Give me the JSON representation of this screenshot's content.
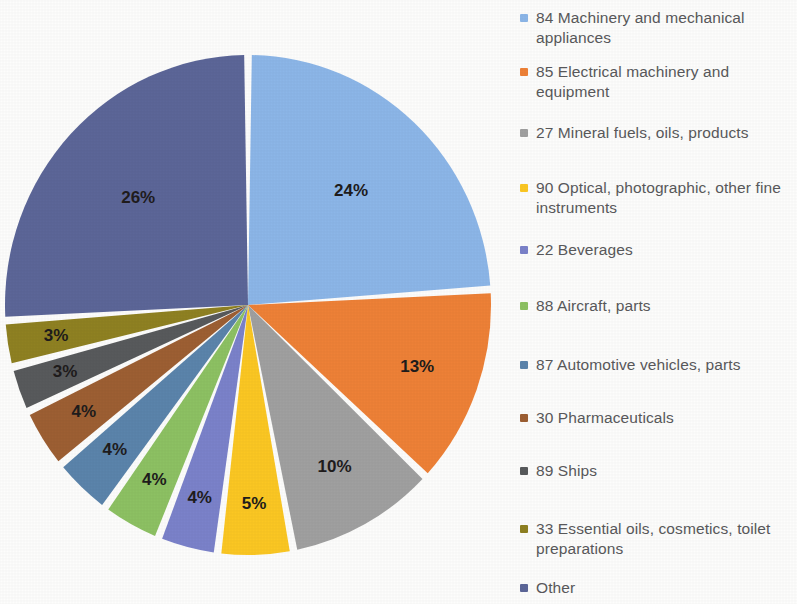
{
  "chart_data": {
    "type": "pie",
    "title": "",
    "subtitle": "",
    "xlabel": "",
    "ylabel": "",
    "legend_position": "right",
    "grid": false,
    "value_suffix": "%",
    "categories": [
      "84 Machinery and mechanical appliances",
      "85 Electrical machinery and equipment",
      "27 Mineral fuels, oils, products",
      "90 Optical, photographic, other fine instruments",
      "22 Beverages",
      "88 Aircraft, parts",
      "87 Automotive vehicles, parts",
      "30 Pharmaceuticals",
      "89 Ships",
      "33 Essential oils, cosmetics, toilet preparations",
      "Other"
    ],
    "values": [
      24,
      13,
      10,
      5,
      4,
      4,
      4,
      4,
      3,
      3,
      26
    ],
    "data_labels": [
      "24%",
      "13%",
      "10%",
      "5%",
      "4%",
      "4%",
      "4%",
      "4%",
      "3%",
      "3%",
      "26%"
    ],
    "colors": [
      "#8cb6e8",
      "#ee8137",
      "#a0a0a0",
      "#fbc723",
      "#7b82ca",
      "#8dc163",
      "#5b84ab",
      "#9d5f33",
      "#585a5c",
      "#8f8122",
      "#5c6698"
    ],
    "slice_separator_color": "#ffffff",
    "start_angle_deg": 0,
    "direction": "clockwise"
  },
  "legend": {
    "items": [
      {
        "label": "84 Machinery and mechanical appliances",
        "color": "#8cb6e8"
      },
      {
        "label": "85 Electrical machinery and equipment",
        "color": "#ee8137"
      },
      {
        "label": "27 Mineral fuels, oils, products",
        "color": "#a0a0a0"
      },
      {
        "label": "90 Optical, photographic, other fine instruments",
        "color": "#fbc723"
      },
      {
        "label": "22 Beverages",
        "color": "#7b82ca"
      },
      {
        "label": "88 Aircraft, parts",
        "color": "#8dc163"
      },
      {
        "label": "87 Automotive vehicles, parts",
        "color": "#5b84ab"
      },
      {
        "label": "30 Pharmaceuticals",
        "color": "#9d5f33"
      },
      {
        "label": "89 Ships",
        "color": "#585a5c"
      },
      {
        "label": "33 Essential oils, cosmetics, toilet preparations",
        "color": "#8f8122"
      },
      {
        "label": "Other",
        "color": "#5c6698"
      }
    ]
  }
}
